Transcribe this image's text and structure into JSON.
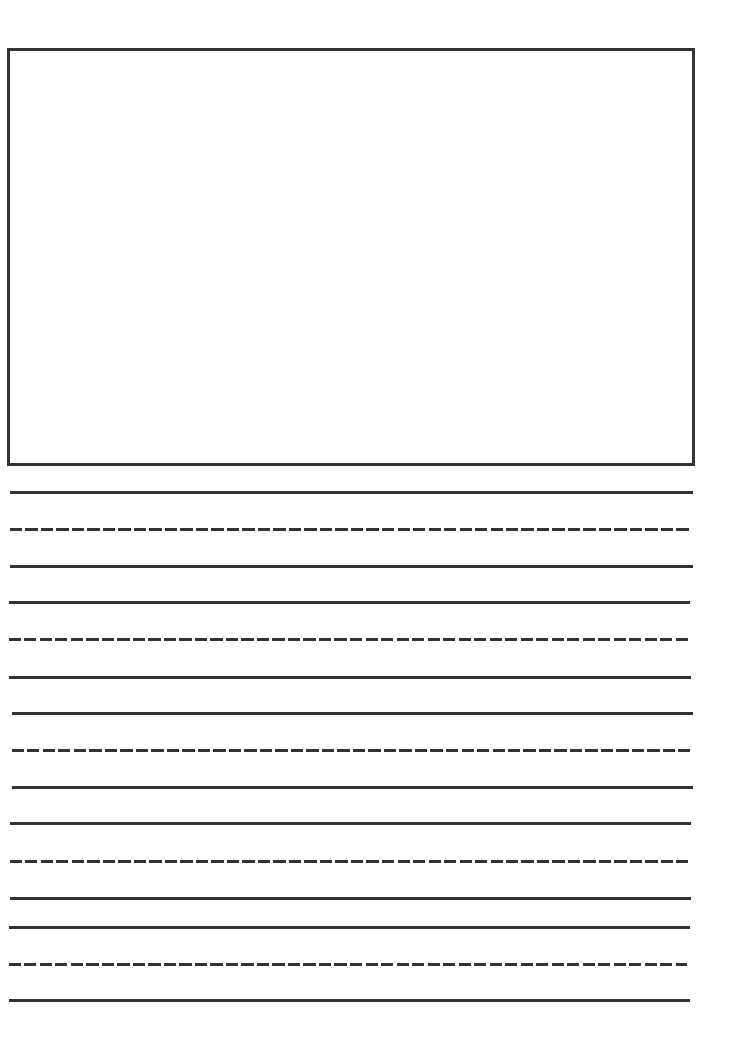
{
  "page": {
    "type": "handwriting-practice-sheet",
    "line_color": "#333333",
    "background": "#ffffff"
  },
  "drawing_box": {
    "label": "",
    "border_color": "#333333"
  },
  "writing_rows": [
    {
      "lines": [
        {
          "style": "solid",
          "y": 491,
          "x1": 10,
          "x2": 693
        },
        {
          "style": "dashed",
          "y": 528,
          "x1": 10,
          "x2": 690
        },
        {
          "style": "solid",
          "y": 565,
          "x1": 10,
          "x2": 693
        }
      ]
    },
    {
      "lines": [
        {
          "style": "solid",
          "y": 601,
          "x1": 9,
          "x2": 690
        },
        {
          "style": "dashed",
          "y": 638,
          "x1": 9,
          "x2": 688
        },
        {
          "style": "solid",
          "y": 676,
          "x1": 9,
          "x2": 691
        }
      ]
    },
    {
      "lines": [
        {
          "style": "solid",
          "y": 712,
          "x1": 12,
          "x2": 693
        },
        {
          "style": "dashed",
          "y": 749,
          "x1": 12,
          "x2": 690
        },
        {
          "style": "solid",
          "y": 786,
          "x1": 12,
          "x2": 693
        }
      ]
    },
    {
      "lines": [
        {
          "style": "solid",
          "y": 822,
          "x1": 10,
          "x2": 691
        },
        {
          "style": "dashed",
          "y": 860,
          "x1": 10,
          "x2": 688
        },
        {
          "style": "solid",
          "y": 897,
          "x1": 10,
          "x2": 691
        }
      ]
    },
    {
      "lines": [
        {
          "style": "solid",
          "y": 926,
          "x1": 9,
          "x2": 690
        },
        {
          "style": "dashed",
          "y": 963,
          "x1": 9,
          "x2": 687
        },
        {
          "style": "solid",
          "y": 999,
          "x1": 9,
          "x2": 690
        }
      ]
    }
  ]
}
